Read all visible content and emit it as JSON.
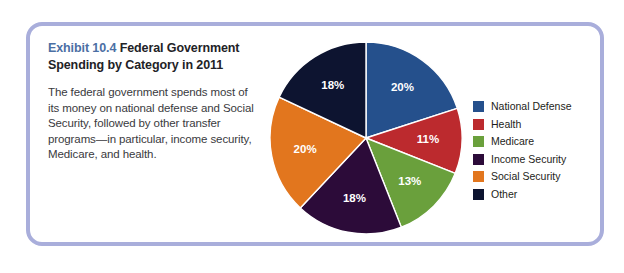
{
  "exhibit": {
    "number": "Exhibit 10.4 ",
    "title": "Federal Government Spending by Category in 2011",
    "description": "The federal government spends most of its money on national defense and Social Security, followed by other transfer programs—in particular, income security, Medicare, and health.",
    "frame_color": "#a9aedb",
    "number_color": "#4b6fa4"
  },
  "chart_data": {
    "type": "pie",
    "title": "Federal Government Spending by Category in 2011",
    "xlabel": "",
    "ylabel": "",
    "legend_position": "right",
    "start_angle_deg": 0,
    "direction": "clockwise",
    "categories": [
      "National Defense",
      "Health",
      "Medicare",
      "Income Security",
      "Social Security",
      "Other"
    ],
    "values": [
      20,
      11,
      13,
      18,
      20,
      18
    ],
    "value_labels": [
      "20%",
      "11%",
      "13%",
      "18%",
      "20%",
      "18%"
    ],
    "colors": [
      "#25508c",
      "#bc2a2e",
      "#6aa03c",
      "#2c0b39",
      "#e2761e",
      "#0d1430"
    ]
  }
}
